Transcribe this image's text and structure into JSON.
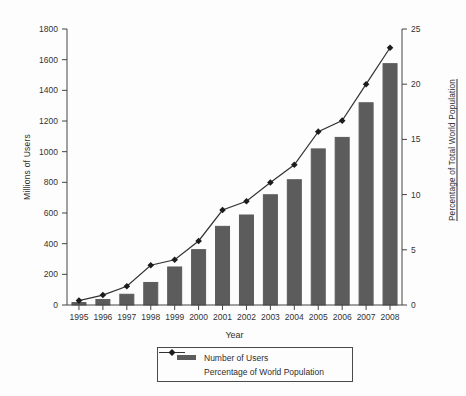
{
  "chart_data": {
    "type": "bar+line",
    "title": "",
    "categories": [
      "1995",
      "1996",
      "1997",
      "1998",
      "1999",
      "2000",
      "2001",
      "2002",
      "2003",
      "2004",
      "2005",
      "2006",
      "2007",
      "2008"
    ],
    "series": [
      {
        "name": "Number of Users",
        "type": "bar",
        "axis": "left",
        "values": [
          16,
          36,
          70,
          147,
          248,
          361,
          513,
          587,
          719,
          817,
          1018,
          1093,
          1319,
          1574
        ]
      },
      {
        "name": "Percentage of World Population",
        "type": "line",
        "axis": "right",
        "marker": "diamond",
        "values": [
          0.4,
          0.9,
          1.7,
          3.6,
          4.1,
          5.8,
          8.6,
          9.4,
          11.1,
          12.7,
          15.7,
          16.7,
          20.0,
          23.3
        ]
      }
    ],
    "xlabel": "Year",
    "ylabel_left": "Millions of Users",
    "ylabel_right": "Percentage of Total World Population",
    "y_left_axis": {
      "min": 0,
      "max": 1800,
      "step": 200
    },
    "y_right_axis": {
      "min": 0,
      "max": 25,
      "step": 5
    },
    "grid": false,
    "legend_position": "bottom",
    "colors": {
      "bar": "#5c5c5c",
      "line": "#333333",
      "marker": "#1c1c1c",
      "axis": "#444444",
      "text": "#333333",
      "background": "#fdfdfd"
    }
  }
}
